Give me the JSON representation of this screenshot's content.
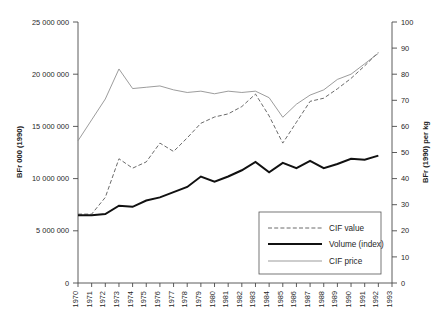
{
  "chart_data": {
    "type": "line",
    "title": "",
    "xlabel": "",
    "ylabel": "BFr 000 (1990)",
    "y2label": "BFr (1990) per kg",
    "x": [
      1970,
      1971,
      1972,
      1973,
      1974,
      1975,
      1976,
      1977,
      1978,
      1979,
      1980,
      1981,
      1982,
      1983,
      1984,
      1985,
      1986,
      1987,
      1988,
      1989,
      1990,
      1991,
      1992
    ],
    "xlim": [
      1970,
      1993
    ],
    "ylim": [
      0,
      25000000
    ],
    "y2lim": [
      0,
      100
    ],
    "ytick_labels": [
      "0",
      "5 000 000",
      "10 000 000",
      "15 000 000",
      "20 000 000",
      "25 000 000"
    ],
    "ytick_values": [
      0,
      5000000,
      10000000,
      15000000,
      20000000,
      25000000
    ],
    "y2tick_labels": [
      "0",
      "10",
      "20",
      "30",
      "40",
      "50",
      "60",
      "70",
      "80",
      "90",
      "100"
    ],
    "y2tick_values": [
      0,
      10,
      20,
      30,
      40,
      50,
      60,
      70,
      80,
      90,
      100
    ],
    "xtick_labels": [
      "1970",
      "1971",
      "1972",
      "1973",
      "1974",
      "1975",
      "1976",
      "1977",
      "1978",
      "1979",
      "1980",
      "1981",
      "1982",
      "1983",
      "1984",
      "1985",
      "1986",
      "1987",
      "1988",
      "1989",
      "1990",
      "1991",
      "1992",
      "1993"
    ],
    "grid": false,
    "legend_position": "lower right",
    "series": [
      {
        "name": "CIF value",
        "axis": "left",
        "style": "dashed",
        "color": "#6b6b6b",
        "values": [
          6600000,
          6600000,
          8200000,
          11900000,
          11000000,
          11600000,
          13400000,
          12600000,
          13900000,
          15300000,
          15900000,
          16200000,
          16900000,
          18100000,
          16000000,
          13400000,
          15400000,
          17400000,
          17700000,
          18600000,
          19600000,
          20800000,
          22100000
        ]
      },
      {
        "name": "Volume (index)",
        "axis": "left",
        "style": "solid-thick",
        "color": "#111111",
        "values": [
          6500000,
          6500000,
          6600000,
          7400000,
          7300000,
          7900000,
          8200000,
          8700000,
          9200000,
          10200000,
          9700000,
          10200000,
          10800000,
          11600000,
          10600000,
          11500000,
          11000000,
          11700000,
          11000000,
          11400000,
          11900000,
          11800000,
          12200000
        ]
      },
      {
        "name": "CIF price",
        "axis": "right",
        "style": "solid-thin",
        "color": "#8a8a8a",
        "values": [
          54.5,
          62.5,
          70.5,
          82.0,
          74.5,
          75.0,
          75.5,
          74.0,
          73.0,
          73.5,
          72.5,
          73.5,
          73.0,
          73.5,
          71.0,
          63.5,
          68.5,
          72.0,
          74.0,
          78.0,
          80.0,
          84.0,
          88.0
        ]
      }
    ]
  },
  "legend": {
    "items": [
      {
        "label": "CIF value"
      },
      {
        "label": "Volume (index)"
      },
      {
        "label": "CIF price"
      }
    ]
  }
}
